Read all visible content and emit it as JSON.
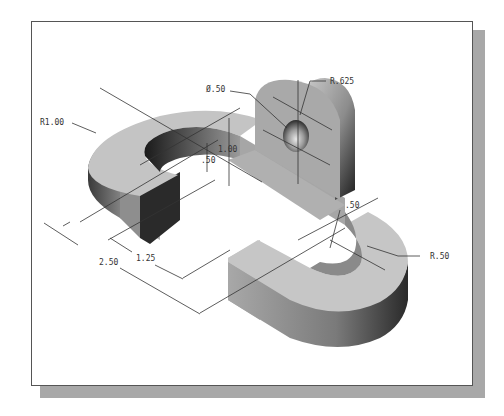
{
  "drawing": {
    "title": "Isometric view of a double U-shaped part with upright boss",
    "colors": {
      "frame_border": "#555555",
      "frame_shadow": "#a8a8a8",
      "surface_light": "#c9c9c9",
      "surface_mid": "#9a9a9a",
      "surface_dark": "#2e2e2e",
      "dimension_line": "#333333"
    },
    "dimensions": {
      "outer_radius_left": "R1.00",
      "hole_diameter": "Ø.50",
      "boss_radius": "R.625",
      "slot_depth": ".50",
      "height": "1.00",
      "slot_width": ".50",
      "inner_radius_right": "R.50",
      "length_inner": "1.25",
      "length_overall": "2.50"
    }
  }
}
